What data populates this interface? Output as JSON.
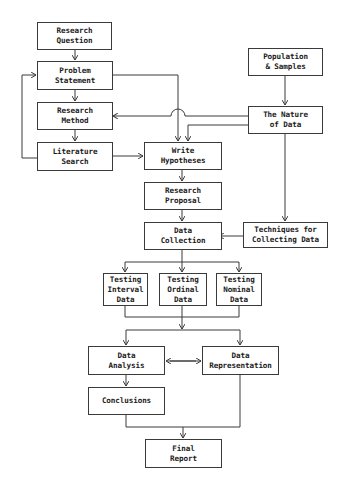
{
  "diagram": {
    "type": "flowchart",
    "line_color": "#3a3a3a",
    "nodes": {
      "research_question": "Research\nQuestion",
      "problem_statement": "Problem\nStatement",
      "research_method": "Research\nMethod",
      "literature_search": "Literature\nSearch",
      "population_samples": "Population\n& Samples",
      "nature_of_data": "The Nature\nof Data",
      "write_hypotheses": "Write\nHypotheses",
      "research_proposal": "Research\nProposal",
      "data_collection": "Data\nCollection",
      "techniques": "Techniques for\nCollecting Data",
      "testing_interval": "Testing\nInterval\nData",
      "testing_ordinal": "Testing\nOrdinal\nData",
      "testing_nominal": "Testing\nNominal\nData",
      "data_analysis": "Data\nAnalysis",
      "data_representation": "Data\nRepresentation",
      "conclusions": "Conclusions",
      "final_report": "Final\nReport"
    },
    "edges": [
      [
        "Research Question",
        "Problem Statement"
      ],
      [
        "Problem Statement",
        "Research Method"
      ],
      [
        "Research Method",
        "Literature Search"
      ],
      [
        "Literature Search",
        "Problem Statement"
      ],
      [
        "Literature Search",
        "Write Hypotheses"
      ],
      [
        "Problem Statement",
        "Write Hypotheses"
      ],
      [
        "Population & Samples",
        "The Nature of Data"
      ],
      [
        "The Nature of Data",
        "Research Method"
      ],
      [
        "The Nature of Data",
        "Write Hypotheses"
      ],
      [
        "The Nature of Data",
        "Techniques for Collecting Data"
      ],
      [
        "Write Hypotheses",
        "Research Proposal"
      ],
      [
        "Research Proposal",
        "Data Collection"
      ],
      [
        "Techniques for Collecting Data",
        "Data Collection"
      ],
      [
        "Data Collection",
        "Testing Interval Data"
      ],
      [
        "Data Collection",
        "Testing Ordinal Data"
      ],
      [
        "Data Collection",
        "Testing Nominal Data"
      ],
      [
        "Testing Data",
        "Data Analysis"
      ],
      [
        "Testing Data",
        "Data Representation"
      ],
      [
        "Data Analysis",
        "Data Representation"
      ],
      [
        "Data Representation",
        "Data Analysis"
      ],
      [
        "Data Analysis",
        "Conclusions"
      ],
      [
        "Conclusions",
        "Final Report"
      ],
      [
        "Data Representation",
        "Final Report"
      ]
    ]
  }
}
